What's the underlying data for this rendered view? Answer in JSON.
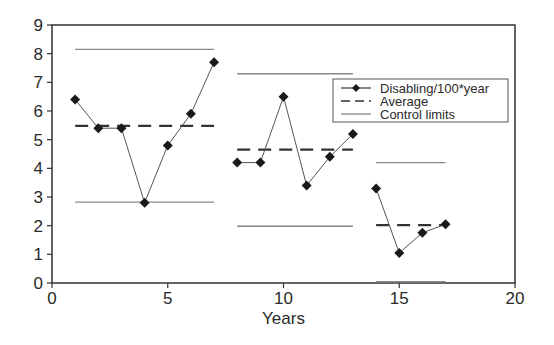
{
  "chart_data": {
    "type": "line",
    "title": "",
    "xlabel": "Years",
    "ylabel": "",
    "xlim": [
      0,
      20
    ],
    "ylim": [
      0,
      9
    ],
    "xticks": [
      0,
      5,
      10,
      15,
      20
    ],
    "yticks": [
      0,
      1,
      2,
      3,
      4,
      5,
      6,
      7,
      8,
      9
    ],
    "grid": false,
    "legend_position": "top-right",
    "legend": [
      {
        "label": "Disabling/100*year",
        "style": "line-diamond"
      },
      {
        "label": "Average",
        "style": "dashed"
      },
      {
        "label": "Control limits",
        "style": "thin-line"
      }
    ],
    "segments": [
      {
        "name": "Period 1",
        "x": [
          1,
          2,
          3,
          4,
          5,
          6,
          7
        ],
        "y": [
          6.4,
          5.4,
          5.4,
          2.8,
          4.8,
          5.9,
          7.7
        ],
        "average": 5.48,
        "ucl": 8.15,
        "lcl": 2.82,
        "x_range": [
          1,
          7
        ]
      },
      {
        "name": "Period 2",
        "x": [
          8,
          9,
          10,
          11,
          12,
          13
        ],
        "y": [
          4.2,
          4.2,
          6.5,
          3.4,
          4.4,
          5.2
        ],
        "average": 4.65,
        "ucl": 7.3,
        "lcl": 1.98,
        "x_range": [
          8,
          13
        ]
      },
      {
        "name": "Period 3",
        "x": [
          14,
          15,
          16,
          17
        ],
        "y": [
          3.3,
          1.05,
          1.75,
          2.05
        ],
        "average": 2.02,
        "ucl": 4.2,
        "lcl": 0.05,
        "x_range": [
          14,
          17
        ]
      }
    ],
    "colors": {
      "series": "#1a1a1a",
      "average": "#333333",
      "control": "#888888",
      "axis": "#333333"
    }
  }
}
